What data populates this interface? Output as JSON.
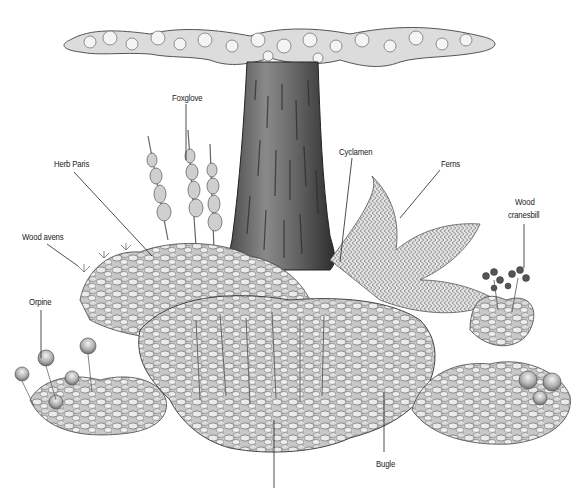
{
  "diagram": {
    "palette": {
      "ink": "#222222",
      "trunk_dark": "#3a3a3a",
      "trunk_mid": "#6e6e6e",
      "foliage_dark": "#5a5a5a",
      "foliage_mid": "#9a9a9a",
      "foliage_light": "#d4d4d4",
      "background": "#ffffff"
    },
    "labels": [
      {
        "id": "foxglove",
        "text": "Foxglove",
        "x": 172,
        "y": 92
      },
      {
        "id": "herb-paris",
        "text": "Herb Paris",
        "x": 54,
        "y": 158
      },
      {
        "id": "cyclamen",
        "text": "Cyclamen",
        "x": 339,
        "y": 146
      },
      {
        "id": "ferns",
        "text": "Ferns",
        "x": 441,
        "y": 158
      },
      {
        "id": "wood-cranesbill-line1",
        "text": "Wood",
        "x": 515,
        "y": 196
      },
      {
        "id": "wood-cranesbill-line2",
        "text": "cranesbill",
        "x": 508,
        "y": 211
      },
      {
        "id": "wood-avens",
        "text": "Wood avens",
        "x": 22,
        "y": 231
      },
      {
        "id": "orpine",
        "text": "Orpine",
        "x": 29,
        "y": 296
      },
      {
        "id": "bugle",
        "text": "Bugle",
        "x": 376,
        "y": 460
      }
    ]
  }
}
